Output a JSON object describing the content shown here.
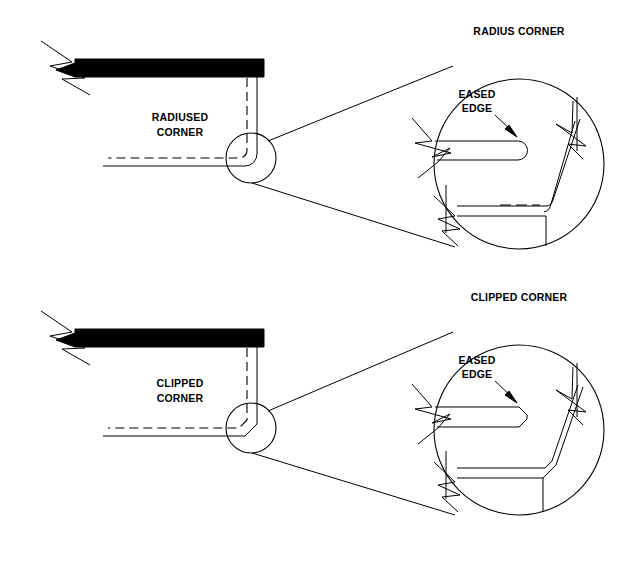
{
  "sheet": {
    "width": 639,
    "height": 576,
    "background": "#ffffff",
    "line_color": "#000000"
  },
  "details": [
    {
      "id": "radius",
      "title": "RADIUS CORNER",
      "plan_label_line1": "RADIUSED",
      "plan_label_line2": "CORNER",
      "eased_edge_line1": "EASED",
      "eased_edge_line2": "EDGE",
      "corner_type": "radiused"
    },
    {
      "id": "clipped",
      "title": "CLIPPED CORNER",
      "plan_label_line1": "CLIPPED",
      "plan_label_line2": "CORNER",
      "eased_edge_line1": "EASED",
      "eased_edge_line2": "EDGE",
      "corner_type": "clipped"
    }
  ],
  "symbols": {
    "break_line": "break-line-zigzag",
    "detail_bubble": "detail-circle",
    "leader": "leader-line"
  }
}
